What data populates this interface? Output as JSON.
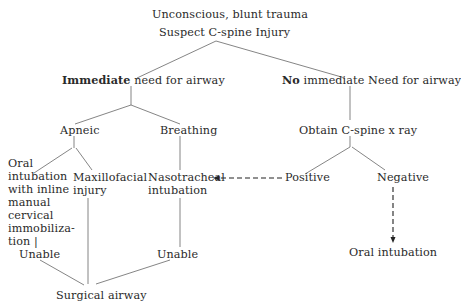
{
  "flowchart": {
    "root": {
      "line1": "Unconscious, blunt trauma",
      "line2": "Suspect C-spine Injury"
    },
    "left_branch": {
      "bold": "Immediate",
      "rest": " need for airway",
      "apneic": "Apneic",
      "breathing": "Breathing",
      "oral_inline": [
        "Oral",
        "intubation",
        "with inline",
        "manual",
        "cervical",
        "immobiliza-",
        "tion |"
      ],
      "maxillofacial": [
        "Maxillofacial",
        "injury"
      ],
      "nasotracheal": [
        "Nasotracheal",
        "intubation"
      ],
      "unable_left": "Unable",
      "unable_right": "Unable",
      "surgical_airway": "Surgical airway"
    },
    "right_branch": {
      "bold": "No",
      "rest": " immediate Need for airway",
      "obtain_xray": "Obtain C-spine x ray",
      "positive": "Positive",
      "negative": "Negative",
      "oral_intubation": "Oral intubation"
    },
    "colors": {
      "line": "#555555",
      "dashed_arrow": "#222222",
      "text": "#2a2a2a",
      "background": "#ffffff"
    }
  }
}
